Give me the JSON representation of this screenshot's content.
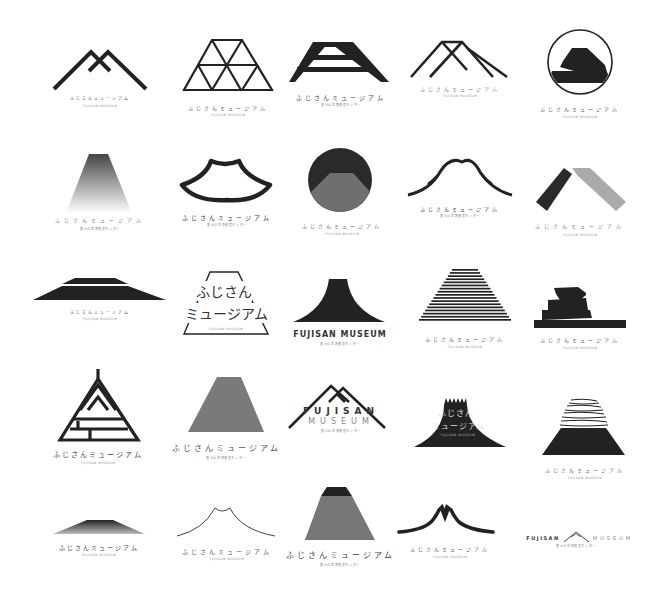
{
  "sheet": {
    "title": "Fujisan Museum logo variations",
    "background": "#ffffff",
    "ink": "#222222",
    "gray": "#777777",
    "light_gray": "#aaaaaa"
  },
  "logos": [
    {
      "id": 1,
      "row": 1,
      "col": 1,
      "shape": "double-m-peaks-outline",
      "jp": "ふじさんミュージアム",
      "en": "FUJISAN MUSEUM"
    },
    {
      "id": 2,
      "row": 1,
      "col": 2,
      "shape": "triangle-grid-trapezoid",
      "jp": "ふじさんミュージアム",
      "en": "FUJISAN MUSEUM"
    },
    {
      "id": 3,
      "row": 1,
      "col": 3,
      "shape": "striped-a-mountain",
      "jp": "ふじさんミュージアム",
      "en": "富士山世界遺産センター"
    },
    {
      "id": 4,
      "row": 1,
      "col": 4,
      "shape": "crossed-peak-lines",
      "jp": "ふじさんミュージアム",
      "en": "FUJISAN MUSEUM"
    },
    {
      "id": 5,
      "row": 1,
      "col": 5,
      "shape": "mountain-in-circle",
      "jp": "ふじさんミュージアム",
      "en": "FUJISAN MUSEUM"
    },
    {
      "id": 6,
      "row": 2,
      "col": 1,
      "shape": "gradient-trapezoid",
      "jp": "ふじさんミュージアム",
      "en": "富士山世界遺産センター"
    },
    {
      "id": 7,
      "row": 2,
      "col": 2,
      "shape": "outlined-fan-mountain",
      "jp": "ふじさんミュージアム",
      "en": "富士山世界遺産センター"
    },
    {
      "id": 8,
      "row": 2,
      "col": 3,
      "shape": "circle-dark-gray-split",
      "jp": "ふじさんミュージアム",
      "en": "FUJISAN MUSEUM"
    },
    {
      "id": 9,
      "row": 2,
      "col": 4,
      "shape": "brush-curve-mountain",
      "jp": "ふじさんミュージアム",
      "en": "富士山世界遺産センター"
    },
    {
      "id": 10,
      "row": 2,
      "col": 5,
      "shape": "two-tone-roof-chevron",
      "jp": "ふじさんミュージアム",
      "en": "FUJISAN MUSEUM"
    },
    {
      "id": 11,
      "row": 3,
      "col": 1,
      "shape": "flat-wide-mountain",
      "jp": "ふじさんミュージアム",
      "en": "FUJISAN MUSEUM"
    },
    {
      "id": 12,
      "row": 3,
      "col": 2,
      "shape": "text-in-trapezoid",
      "jp_line1": "ふじさん",
      "jp_line2": "ミュージアム",
      "en": "FUJISAN MUSEUM"
    },
    {
      "id": 13,
      "row": 3,
      "col": 3,
      "shape": "solid-concave-mountain",
      "title": "FUJISAN MUSEUM",
      "en": "富士山世界遺産センター"
    },
    {
      "id": 14,
      "row": 3,
      "col": 4,
      "shape": "horizontal-lines-trapezoid",
      "jp": "ふじさんミュージアム",
      "en": "FUJISAN MUSEUM"
    },
    {
      "id": 15,
      "row": 3,
      "col": 5,
      "shape": "zigzag-stacked-bars",
      "jp": "ふじさんミュージアム",
      "en": "FUJISAN MUSEUM"
    },
    {
      "id": 16,
      "row": 4,
      "col": 1,
      "shape": "geometric-a-triangle",
      "jp": "ふじさんミュージアム",
      "en": "FUJISAN MUSEUM"
    },
    {
      "id": 17,
      "row": 4,
      "col": 2,
      "shape": "gray-trapezoid",
      "jp": "ふじさんミュージアム",
      "en": "富士山世界遺産センター"
    },
    {
      "id": 18,
      "row": 4,
      "col": 3,
      "shape": "double-peak-with-wordmark",
      "title_line1": "FUJISAN",
      "title_line2": "MUSEUM",
      "en": "富士山世界遺産センター"
    },
    {
      "id": 19,
      "row": 4,
      "col": 4,
      "shape": "crenellated-mountain-text",
      "jp_line1": "ふじさん",
      "jp_line2": "ミュージアム",
      "en": "FUJISAN MUSEUM"
    },
    {
      "id": 20,
      "row": 4,
      "col": 5,
      "shape": "brushstroke-top-trapezoid",
      "jp": "ふじさんミュージアム",
      "en": "FUJISAN MUSEUM"
    },
    {
      "id": 21,
      "row": 5,
      "col": 1,
      "shape": "gradient-low-mountain",
      "jp": "ふじさんミュージアム",
      "en": "FUJISAN MUSEUM"
    },
    {
      "id": 22,
      "row": 5,
      "col": 2,
      "shape": "thin-curve-outline",
      "jp": "ふじさんミュージアム",
      "en": "FUJISAN MUSEUM"
    },
    {
      "id": 23,
      "row": 5,
      "col": 3,
      "shape": "gray-trapezoid-dark-cap",
      "jp": "ふじさんミュージアム",
      "en": "富士山世界遺産センター"
    },
    {
      "id": 24,
      "row": 5,
      "col": 4,
      "shape": "calligraphic-m-stroke",
      "jp": "ふじさんミュージアム",
      "en": "FUJISAN MUSEUM"
    },
    {
      "id": 25,
      "row": 5,
      "col": 5,
      "shape": "inline-wordmark",
      "left": "FUJISAN",
      "right": "MUSEUM",
      "en": "富士山世界遺産センター"
    }
  ]
}
